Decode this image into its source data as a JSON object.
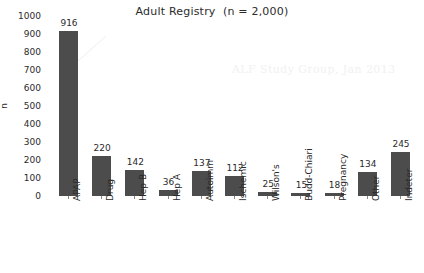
{
  "chart_data": {
    "type": "bar",
    "title": "Adult Registry  (n = 2,000)",
    "xlabel": "",
    "ylabel": "n",
    "ylim": [
      0,
      1000
    ],
    "ytick_step": 100,
    "yticks": [
      0,
      100,
      200,
      300,
      400,
      500,
      600,
      700,
      800,
      900,
      1000
    ],
    "grid": false,
    "legend": "none",
    "bar_color": "#4c4c4c",
    "value_labels": true,
    "categories": [
      "APAP",
      "Drug",
      "Hep B",
      "Hep A",
      "Autoimm",
      "Ischemic",
      "Wilson's",
      "Budd-Chiari",
      "Pregnancy",
      "Other",
      "Indeter"
    ],
    "values": [
      916,
      220,
      142,
      36,
      137,
      112,
      25,
      15,
      18,
      134,
      245
    ],
    "annotations": [
      "ALF Study Group, Jan 2013"
    ]
  },
  "watermark": {
    "text": "ALF Study Group, Jan 2013"
  }
}
